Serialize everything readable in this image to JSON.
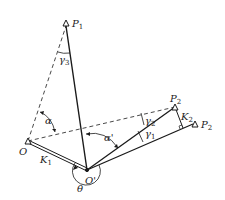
{
  "diagram": {
    "type": "geometric-kinematic-diagram",
    "colors": {
      "line": "#1a1a1a",
      "dashed": "#333333",
      "background": "#ffffff"
    },
    "points": {
      "P1": {
        "label": "P",
        "sub": "1"
      },
      "P2_upper": {
        "label": "P",
        "sub": "2"
      },
      "P2_lower": {
        "label": "P",
        "sub": "2"
      },
      "O": {
        "label": "O"
      },
      "O_prime": {
        "label": "O'"
      }
    },
    "links": {
      "K1": {
        "label": "K",
        "sub": "1"
      },
      "K2": {
        "label": "K",
        "sub": "2"
      }
    },
    "angles": {
      "alpha": {
        "label": "α"
      },
      "alpha_prime": {
        "label": "α'"
      },
      "gamma1": {
        "label": "γ",
        "sub": "1"
      },
      "gamma2": {
        "label": "γ",
        "sub": "2"
      },
      "gamma3": {
        "label": "γ",
        "sub": "3"
      },
      "theta": {
        "label": "θ"
      }
    }
  }
}
